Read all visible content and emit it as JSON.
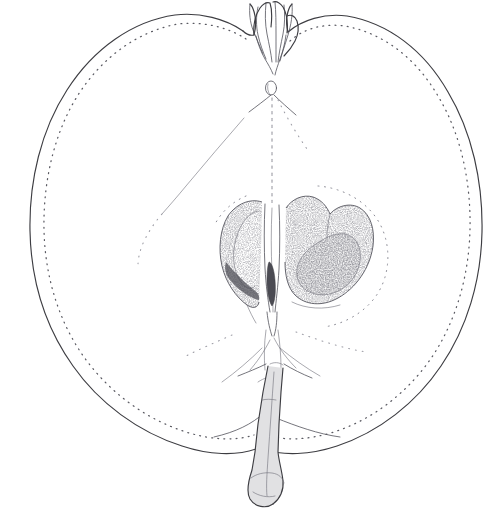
{
  "illustration": {
    "title": "Apple fruit, longitudinal section",
    "subject": "apple",
    "view": "longitudinal-median-section",
    "technique": "pen-and-ink stipple line drawing",
    "background_color": "#ffffff",
    "ink_color": "#3d3d42",
    "stipple_color": "#5a5a62",
    "faint_color": "#9b9ba4",
    "canvas": {
      "width": 501,
      "height": 519
    },
    "caption": "",
    "labels": []
  },
  "parts": [
    {
      "id": "fruit-outline",
      "name": "fruit-outline",
      "label": "Fruit body outline",
      "description": "Broad ovate apple silhouette, slightly wider than tall, flattened at the calyx end"
    },
    {
      "id": "skin-stipple",
      "name": "skin-stipple-line",
      "label": "Skin / epidermis stipple",
      "description": "Dotted line running parallel just inside the outline indicating the cut skin"
    },
    {
      "id": "calyx",
      "name": "calyx",
      "label": "Calyx and withered sepals",
      "description": "Tufted remains of sepals at the top of the fruit in the calyx basin"
    },
    {
      "id": "calyx-tube",
      "name": "calyx-tube",
      "label": "Calyx tube / core axis",
      "description": "Dotted axial line descending from the calyx to the seed cavity"
    },
    {
      "id": "core-line",
      "name": "core-outline",
      "label": "Core boundary",
      "description": "Faint dotted arc delimiting the core tissue around the locules"
    },
    {
      "id": "locule-left",
      "name": "locule-left",
      "label": "Left seed chamber (locule)",
      "description": "Stippled carpel cavity to the left of the central axis"
    },
    {
      "id": "locule-right",
      "name": "locule-right",
      "label": "Right seed chamber (locule)",
      "description": "Heart-shaped stippled carpel cavity to the right of the central axis"
    },
    {
      "id": "seed-left",
      "name": "seed-left",
      "label": "Left seed (pip)",
      "description": "Pale teardrop seed set inside the left locule"
    },
    {
      "id": "seed-right",
      "name": "seed-right",
      "label": "Right seed (pip)",
      "description": "Dark stippled teardrop seed set inside the right locule"
    },
    {
      "id": "central-axis",
      "name": "central-axis",
      "label": "Central axis / placenta column",
      "description": "Narrow vertical column of tissue separating the two locules"
    },
    {
      "id": "vascular-bundles",
      "name": "vascular-bundles",
      "label": "Vascular strands",
      "description": "Faint dotted strands fanning from the stem base out through the flesh"
    },
    {
      "id": "stem",
      "name": "stem",
      "label": "Stem (peduncle)",
      "description": "Stout stippled stalk descending from the basal cavity with a knobbed tip"
    },
    {
      "id": "stem-cavity",
      "name": "stem-cavity",
      "label": "Stem cavity",
      "description": "Shallow depression in the base of the fruit around the stem insertion"
    }
  ]
}
